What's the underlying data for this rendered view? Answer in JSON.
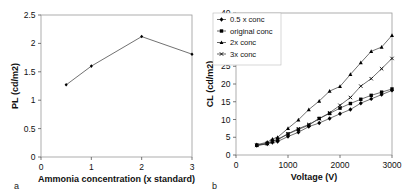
{
  "figure": {
    "panels": [
      {
        "letter": "a",
        "chart_data": {
          "type": "line",
          "title": "",
          "xlabel": "Ammonia concentration (x standard)",
          "ylabel": "PL (cd/m2)",
          "xlim": [
            0,
            3
          ],
          "ylim": [
            0,
            2.5
          ],
          "xticks": [
            0,
            1,
            2,
            3
          ],
          "xticklabels": [
            "0",
            "1",
            "2",
            "3"
          ],
          "yticks": [
            0,
            0.5,
            1,
            1.5,
            2,
            2.5
          ],
          "yticklabels": [
            "0",
            "0.5",
            "1",
            "1.5",
            "2",
            "2.5"
          ],
          "grid": false,
          "legend": "none",
          "marker": "diamond",
          "series": [
            {
              "name": "PL",
              "x": [
                0.5,
                1,
                2,
                3
              ],
              "values": [
                1.27,
                1.6,
                2.12,
                1.81
              ]
            }
          ]
        }
      },
      {
        "letter": "b",
        "chart_data": {
          "type": "line",
          "title": "",
          "xlabel": "Voltage (V)",
          "ylabel": "CL (cd/m2)",
          "xlim": [
            0,
            3000
          ],
          "ylim": [
            0,
            40
          ],
          "xticks": [
            0,
            1000,
            2000,
            3000
          ],
          "xticklabels": [
            "0",
            "1000",
            "2000",
            "3000"
          ],
          "yticks": [
            0,
            5,
            10,
            15,
            20,
            25,
            30,
            35,
            40
          ],
          "yticklabels": [
            "0",
            "5",
            "10",
            "15",
            "20",
            "25",
            "30",
            "35",
            "40"
          ],
          "grid": false,
          "legend": "upper-left",
          "series": [
            {
              "name": "0.5 x conc",
              "marker": "diamond",
              "x": [
                400,
                600,
                700,
                800,
                1000,
                1200,
                1400,
                1600,
                1800,
                2000,
                2200,
                2400,
                2600,
                2800,
                3000
              ],
              "values": [
                2.7,
                3.1,
                3.5,
                3.8,
                5.2,
                6.4,
                8.0,
                9.0,
                10.3,
                11.6,
                12.8,
                14.6,
                15.8,
                17.0,
                18.2
              ]
            },
            {
              "name": "original conc",
              "marker": "square",
              "x": [
                400,
                600,
                700,
                800,
                1000,
                1200,
                1400,
                1600,
                1800,
                2000,
                2200,
                2400,
                2600,
                2800,
                3000
              ],
              "values": [
                2.8,
                3.3,
                3.9,
                4.3,
                5.9,
                7.2,
                8.4,
                10.3,
                11.7,
                13.2,
                14.5,
                15.7,
                16.8,
                17.7,
                18.6
              ]
            },
            {
              "name": "2x conc",
              "marker": "triangle",
              "x": [
                400,
                600,
                700,
                800,
                1000,
                1200,
                1400,
                1600,
                1800,
                2000,
                2200,
                2400,
                2600,
                2800,
                3000
              ],
              "values": [
                2.9,
                3.6,
                4.5,
                5.0,
                7.5,
                9.9,
                12.8,
                15.2,
                18.0,
                19.3,
                22.7,
                26.0,
                29.2,
                30.4,
                33.7
              ]
            },
            {
              "name": "3x conc",
              "marker": "cross",
              "x": [
                400,
                600,
                700,
                800,
                1000,
                1200,
                1400,
                1600,
                1800,
                2000,
                2200,
                2400,
                2600,
                2800,
                3000
              ],
              "values": [
                2.7,
                3.2,
                3.8,
                4.4,
                6.0,
                7.4,
                8.6,
                10.2,
                11.9,
                14.0,
                16.2,
                19.4,
                21.5,
                24.3,
                27.2
              ]
            }
          ]
        }
      }
    ]
  }
}
